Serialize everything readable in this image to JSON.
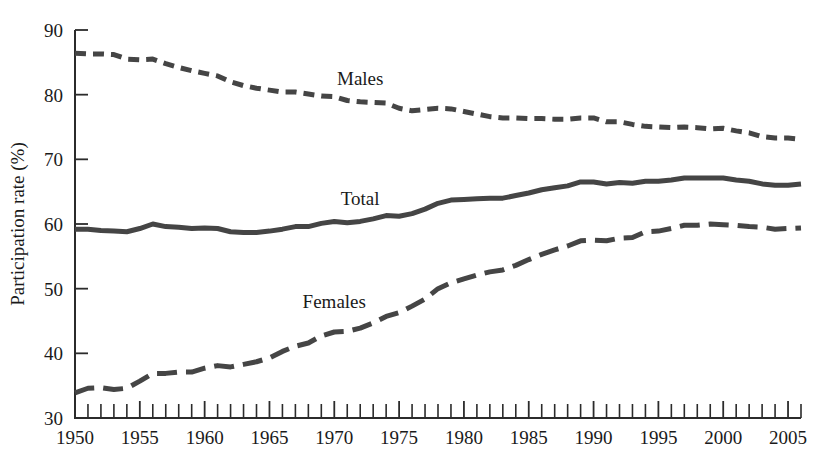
{
  "chart_data": {
    "type": "line",
    "title": "",
    "xlabel": "",
    "ylabel": "Participation rate (%)",
    "ylim": [
      30,
      90
    ],
    "xlim": [
      1950,
      2006
    ],
    "yticks": [
      30,
      40,
      50,
      60,
      70,
      80,
      90
    ],
    "xticks_labeled": [
      1950,
      1955,
      1960,
      1965,
      1970,
      1975,
      1980,
      1985,
      1990,
      1995,
      2000,
      2005
    ],
    "xtick_interval": 1,
    "grid": false,
    "legend_position": "inline-annotations",
    "x": [
      1950,
      1951,
      1952,
      1953,
      1954,
      1955,
      1956,
      1957,
      1958,
      1959,
      1960,
      1961,
      1962,
      1963,
      1964,
      1965,
      1966,
      1967,
      1968,
      1969,
      1970,
      1971,
      1972,
      1973,
      1974,
      1975,
      1976,
      1977,
      1978,
      1979,
      1980,
      1981,
      1982,
      1983,
      1984,
      1985,
      1986,
      1987,
      1988,
      1989,
      1990,
      1991,
      1992,
      1993,
      1994,
      1995,
      1996,
      1997,
      1998,
      1999,
      2000,
      2001,
      2002,
      2003,
      2004,
      2005,
      2006
    ],
    "series": [
      {
        "name": "Males",
        "line_style": "short-dashed",
        "color": "#454545",
        "values": [
          86.4,
          86.3,
          86.3,
          86.2,
          85.5,
          85.4,
          85.5,
          84.8,
          84.2,
          83.7,
          83.3,
          82.9,
          82.0,
          81.4,
          81.0,
          80.7,
          80.4,
          80.4,
          80.1,
          79.8,
          79.7,
          79.1,
          78.9,
          78.8,
          78.7,
          77.9,
          77.5,
          77.7,
          77.9,
          77.8,
          77.4,
          77.0,
          76.6,
          76.4,
          76.4,
          76.3,
          76.3,
          76.2,
          76.2,
          76.4,
          76.4,
          75.8,
          75.8,
          75.4,
          75.1,
          75.0,
          74.9,
          75.0,
          74.9,
          74.7,
          74.8,
          74.4,
          74.1,
          73.5,
          73.3,
          73.3,
          73.1
        ]
      },
      {
        "name": "Total",
        "line_style": "solid",
        "color": "#454545",
        "values": [
          59.2,
          59.2,
          59.0,
          58.9,
          58.8,
          59.3,
          60.0,
          59.6,
          59.5,
          59.3,
          59.4,
          59.3,
          58.8,
          58.7,
          58.7,
          58.9,
          59.2,
          59.6,
          59.6,
          60.1,
          60.4,
          60.2,
          60.4,
          60.8,
          61.3,
          61.2,
          61.6,
          62.3,
          63.2,
          63.7,
          63.8,
          63.9,
          64.0,
          64.0,
          64.4,
          64.8,
          65.3,
          65.6,
          65.9,
          66.5,
          66.5,
          66.2,
          66.4,
          66.3,
          66.6,
          66.6,
          66.8,
          67.1,
          67.1,
          67.1,
          67.1,
          66.8,
          66.6,
          66.2,
          66.0,
          66.0,
          66.2
        ]
      },
      {
        "name": "Females",
        "line_style": "long-dashed",
        "color": "#454545",
        "values": [
          33.9,
          34.6,
          34.7,
          34.4,
          34.6,
          35.7,
          36.9,
          36.9,
          37.1,
          37.1,
          37.7,
          38.1,
          37.9,
          38.3,
          38.7,
          39.3,
          40.3,
          41.1,
          41.6,
          42.7,
          43.3,
          43.4,
          43.9,
          44.7,
          45.7,
          46.3,
          47.3,
          48.4,
          50.0,
          50.9,
          51.5,
          52.1,
          52.6,
          52.9,
          53.6,
          54.5,
          55.3,
          56.0,
          56.6,
          57.4,
          57.5,
          57.4,
          57.8,
          57.9,
          58.8,
          58.9,
          59.3,
          59.8,
          59.8,
          60.0,
          59.9,
          59.8,
          59.6,
          59.5,
          59.2,
          59.3,
          59.4
        ]
      }
    ],
    "annotations": [
      {
        "text": "Males",
        "x": 1972,
        "y": 81.5
      },
      {
        "text": "Total",
        "x": 1972,
        "y": 63.0
      },
      {
        "text": "Females",
        "x": 1970,
        "y": 47.0
      }
    ]
  }
}
